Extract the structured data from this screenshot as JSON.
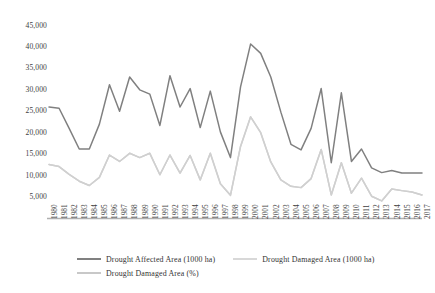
{
  "chart_data": {
    "type": "line",
    "title": "",
    "xlabel": "",
    "ylabel": "",
    "ylim": [
      0,
      45000
    ],
    "ytick_values": [
      5000,
      10000,
      15000,
      20000,
      25000,
      30000,
      35000,
      40000,
      45000
    ],
    "ytick_labels": [
      "5,000",
      "10,000",
      "15,000",
      "20,000",
      "25,000",
      "30,000",
      "35,000",
      "40,000",
      "45,000"
    ],
    "grid": false,
    "legend_position": "bottom",
    "categories": [
      "1980",
      "1981",
      "1982",
      "1983",
      "1984",
      "1985",
      "1986",
      "1987",
      "1988",
      "1989",
      "1990",
      "1991",
      "1992",
      "1993",
      "1994",
      "1995",
      "1996",
      "1997",
      "1998",
      "1999",
      "2000",
      "2001",
      "2002",
      "2003",
      "2004",
      "2005",
      "2006",
      "2007",
      "2008",
      "2009",
      "2010",
      "2011",
      "2012",
      "2013",
      "2014",
      "2015",
      "2016",
      "2017"
    ],
    "series": [
      {
        "name": "Drought   Affected Area (1000 ha)",
        "color": "#808080",
        "values": [
          26000,
          25700,
          21000,
          16200,
          16200,
          22000,
          31200,
          25000,
          33000,
          30000,
          29000,
          21700,
          33300,
          26000,
          30300,
          21200,
          29700,
          20200,
          14200,
          30700,
          40700,
          38500,
          33000,
          24800,
          17300,
          16000,
          21000,
          30300,
          13000,
          29300,
          13300,
          16200,
          11800,
          10700,
          11200,
          10600,
          10600,
          10600
        ]
      },
      {
        "name": "Drought   Damaged Area (1000 ha)",
        "color": "#d0d0d0",
        "values": [
          12600,
          12100,
          10300,
          8700,
          7700,
          9600,
          14800,
          13300,
          15200,
          14200,
          15200,
          10200,
          14800,
          10600,
          14700,
          9000,
          15200,
          8100,
          5400,
          16800,
          23700,
          20000,
          13200,
          9000,
          7500,
          7200,
          9300,
          16100,
          5500,
          13000,
          5900,
          9400,
          5200,
          4100,
          6900,
          6500,
          6200,
          5500
        ]
      },
      {
        "name": "Drought   Damaged Area (%)",
        "color": "#cfcfcf",
        "values": [
          12600,
          12100,
          10300,
          8700,
          7700,
          9600,
          14800,
          13300,
          15200,
          14200,
          15200,
          10200,
          14800,
          10600,
          14700,
          9000,
          15200,
          8100,
          5400,
          16800,
          23700,
          20000,
          13200,
          9000,
          7500,
          7200,
          9300,
          16100,
          5500,
          13000,
          5900,
          9400,
          5200,
          4100,
          6900,
          6500,
          6200,
          5500
        ]
      }
    ]
  },
  "axis": {
    "baseline_color": "#b0b0b0"
  },
  "legend": {
    "items": [
      {
        "label": "Drought   Affected Area (1000 ha)",
        "color": "#808080"
      },
      {
        "label": "Drought   Damaged Area (1000 ha)",
        "color": "#d8d8d8"
      },
      {
        "label": "Drought   Damaged Area (%)",
        "color": "#c8c8c8"
      }
    ]
  }
}
